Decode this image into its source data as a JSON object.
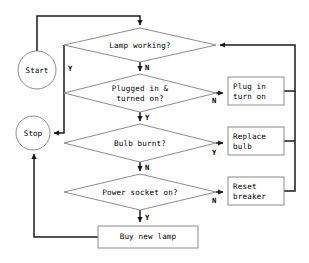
{
  "diagram": {
    "type": "flowchart",
    "colors": {
      "shape_stroke": "#8c8c8c",
      "connector_stroke": "#1a1a1a",
      "shape_fill": "#ffffff",
      "text": "#000000",
      "background": "#ffffff"
    },
    "terminators": [
      {
        "id": "start",
        "label": "Start",
        "shape": "ellipse",
        "cx": 37,
        "cy": 70,
        "rx": 19,
        "ry": 19
      },
      {
        "id": "stop",
        "label": "Stop",
        "shape": "ellipse",
        "cx": 33,
        "cy": 133,
        "rx": 17,
        "ry": 17
      }
    ],
    "decisions": [
      {
        "id": "lamp-working",
        "lines": [
          "Lamp working?"
        ],
        "cx": 140,
        "cy": 45,
        "hw": 76,
        "hh": 17,
        "yes_label": "Y",
        "no_label": "N"
      },
      {
        "id": "plugged-in",
        "lines": [
          "Plugged in &",
          "turned on?"
        ],
        "cx": 140,
        "cy": 93,
        "hw": 76,
        "hh": 19,
        "yes_label": "Y",
        "no_label": "N"
      },
      {
        "id": "bulb-burnt",
        "lines": [
          "Bulb burnt?"
        ],
        "cx": 140,
        "cy": 143,
        "hw": 76,
        "hh": 19,
        "yes_label": "Y",
        "no_label": "N"
      },
      {
        "id": "power-socket",
        "lines": [
          "Power socket on?"
        ],
        "cx": 140,
        "cy": 192,
        "hw": 76,
        "hh": 18,
        "yes_label": "Y",
        "no_label": "N"
      }
    ],
    "processes": [
      {
        "id": "plug-in-turn-on",
        "lines": [
          "Plug in",
          "turn on"
        ],
        "x": 228,
        "y": 77,
        "w": 56,
        "h": 28,
        "align": "left"
      },
      {
        "id": "replace-bulb",
        "lines": [
          "Replace",
          "bulb"
        ],
        "x": 228,
        "y": 127,
        "w": 56,
        "h": 28,
        "align": "left"
      },
      {
        "id": "reset-breaker",
        "lines": [
          "Reset",
          "breaker"
        ],
        "x": 228,
        "y": 177,
        "w": 56,
        "h": 28,
        "align": "left"
      },
      {
        "id": "buy-new-lamp",
        "lines": [
          "Buy new lamp"
        ],
        "x": 98,
        "y": 226,
        "w": 100,
        "h": 22,
        "align": "center"
      }
    ],
    "branch_labels": [
      {
        "id": "lamp-working-yes",
        "text": "Y",
        "x": 68,
        "y": 64
      },
      {
        "id": "lamp-working-no",
        "text": "N",
        "x": 145,
        "y": 63
      },
      {
        "id": "plugged-in-no",
        "text": "N",
        "x": 212,
        "y": 96
      },
      {
        "id": "plugged-in-yes",
        "text": "Y",
        "x": 145,
        "y": 113
      },
      {
        "id": "bulb-burnt-yes",
        "text": "Y",
        "x": 212,
        "y": 148
      },
      {
        "id": "bulb-burnt-no",
        "text": "N",
        "x": 145,
        "y": 163
      },
      {
        "id": "power-socket-no",
        "text": "N",
        "x": 212,
        "y": 196
      },
      {
        "id": "power-socket-yes",
        "text": "Y",
        "x": 145,
        "y": 213
      }
    ],
    "edges": [
      {
        "id": "start-to-lamp-working",
        "from": "start",
        "to": "lamp-working",
        "label": ""
      },
      {
        "id": "lamp-working-yes-to-stop",
        "from": "lamp-working",
        "to": "stop",
        "label": "Y"
      },
      {
        "id": "lamp-working-no-to-plugged-in",
        "from": "lamp-working",
        "to": "plugged-in",
        "label": "N"
      },
      {
        "id": "plugged-in-no-to-plug-in",
        "from": "plugged-in",
        "to": "plug-in-turn-on",
        "label": "N"
      },
      {
        "id": "plugged-in-yes-to-bulb-burnt",
        "from": "plugged-in",
        "to": "bulb-burnt",
        "label": "Y"
      },
      {
        "id": "bulb-burnt-yes-to-replace-bulb",
        "from": "bulb-burnt",
        "to": "replace-bulb",
        "label": "Y"
      },
      {
        "id": "bulb-burnt-no-to-power-socket",
        "from": "bulb-burnt",
        "to": "power-socket",
        "label": "N"
      },
      {
        "id": "power-socket-no-to-reset-breaker",
        "from": "power-socket",
        "to": "reset-breaker",
        "label": "N"
      },
      {
        "id": "power-socket-yes-to-buy-new-lamp",
        "from": "power-socket",
        "to": "buy-new-lamp",
        "label": "Y"
      },
      {
        "id": "plug-in-back-to-lamp-working",
        "from": "plug-in-turn-on",
        "to": "lamp-working",
        "label": ""
      },
      {
        "id": "replace-bulb-back-to-lamp-working",
        "from": "replace-bulb",
        "to": "lamp-working",
        "label": ""
      },
      {
        "id": "reset-breaker-back-to-lamp-working",
        "from": "reset-breaker",
        "to": "lamp-working",
        "label": ""
      },
      {
        "id": "buy-new-lamp-to-stop",
        "from": "buy-new-lamp",
        "to": "stop",
        "label": ""
      }
    ]
  }
}
